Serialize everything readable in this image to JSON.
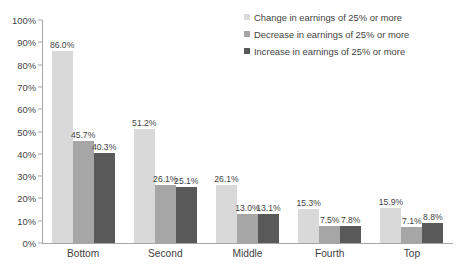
{
  "chart_data": {
    "type": "bar",
    "title": "",
    "subtitle": "",
    "xlabel": "",
    "ylabel": "",
    "ylim": [
      0,
      100
    ],
    "ytick_step": 10,
    "grid": false,
    "legend_position": "top-right",
    "value_suffix": "%",
    "categories": [
      "Bottom",
      "Second",
      "Middle",
      "Fourth",
      "Top"
    ],
    "ytick_labels": [
      "100%",
      "90%",
      "80%",
      "70%",
      "60%",
      "50%",
      "40%",
      "30%",
      "20%",
      "10%",
      "0%"
    ],
    "ytick_values": [
      100,
      90,
      80,
      70,
      60,
      50,
      40,
      30,
      20,
      10,
      0
    ],
    "series": [
      {
        "name": "Change in earnings of 25% or more",
        "color": "#d9d9d9",
        "values": [
          86.0,
          51.2,
          26.1,
          15.3,
          15.9
        ],
        "labels": [
          "86.0%",
          "51.2%",
          "26.1%",
          "15.3%",
          "15.9%"
        ]
      },
      {
        "name": "Decrease in earnings of 25% or more",
        "color": "#a6a6a6",
        "values": [
          45.7,
          26.1,
          13.0,
          7.5,
          7.1
        ],
        "labels": [
          "45.7%",
          "26.1%",
          "13.0%",
          "7.5%",
          "7.1%"
        ]
      },
      {
        "name": "Increase in earnings of 25% or more",
        "color": "#595959",
        "values": [
          40.3,
          25.1,
          13.1,
          7.8,
          8.8
        ],
        "labels": [
          "40.3%",
          "25.1%",
          "13.1%",
          "7.8%",
          "8.8%"
        ]
      }
    ]
  }
}
